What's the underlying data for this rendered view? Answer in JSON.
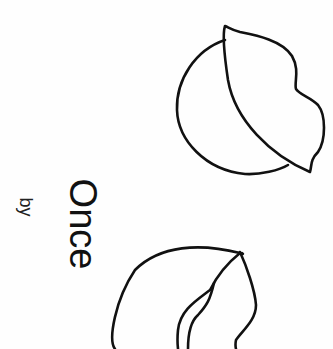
{
  "page": {
    "title": "Once",
    "byline": "by",
    "illustrations": [
      "nut-with-leaf-icon",
      "open-nut-icon"
    ],
    "colors": {
      "ink": "#111111",
      "paper": "#fefefe"
    }
  }
}
